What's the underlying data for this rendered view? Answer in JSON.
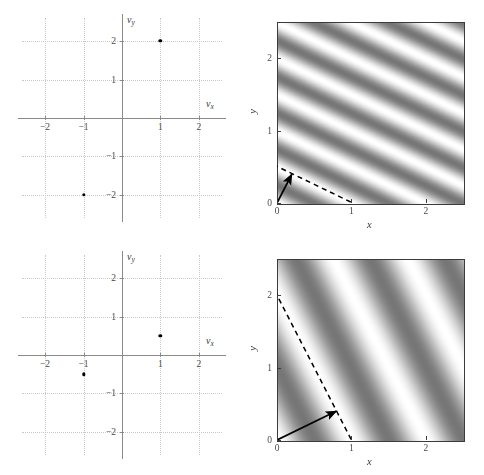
{
  "figure": {
    "title": "",
    "background": "#ffffff",
    "width": 484,
    "height": 475,
    "layout": "2 rows x 2 columns: left column = spatial-frequency spectrum scatter, right column = corresponding 2-D sinusoidal grating image"
  },
  "colors": {
    "ink": "#000000",
    "axis": "#8a8a8a",
    "grid": "#c9c9c9",
    "tick_text": "#4a4a4a",
    "image_border": "#3b3b3b",
    "grating_light": "#ffffff",
    "grating_dark": "#808080"
  },
  "chart_data": [
    {
      "id": "spectrum-top",
      "type": "scatter",
      "title": "",
      "xlabel": "νx",
      "ylabel": "νy",
      "xlabel_parts": {
        "symbol": "ν",
        "sub": "x"
      },
      "ylabel_parts": {
        "symbol": "ν",
        "sub": "y"
      },
      "xlim": [
        -2.6,
        2.6
      ],
      "ylim": [
        -2.6,
        2.6
      ],
      "xticks": [
        -2,
        -1,
        1,
        2
      ],
      "yticks": [
        -2,
        -1,
        1,
        2
      ],
      "xticklabels": [
        "−2",
        "−1",
        "1",
        "2"
      ],
      "yticklabels": [
        "−2",
        "−1",
        "1",
        "2"
      ],
      "grid": true,
      "gridstyle": "dotted",
      "points": [
        {
          "x": 1,
          "y": 2
        },
        {
          "x": -1,
          "y": -2
        }
      ],
      "marker": "filled circle",
      "note": "conjugate-symmetric pair of delta functions at ±(1, 2)"
    },
    {
      "id": "grating-top",
      "type": "heatmap",
      "title": "",
      "xlabel": "x",
      "ylabel": "y",
      "xlim": [
        0,
        2.5
      ],
      "ylim": [
        0,
        2.5
      ],
      "xticks": [
        0,
        1,
        2
      ],
      "yticks": [
        0,
        1,
        2
      ],
      "xticklabels": [
        "0",
        "1",
        "2"
      ],
      "yticklabels": [
        "0",
        "1",
        "2"
      ],
      "grid": false,
      "colormap": "gray",
      "function": "cos(2*pi*(1*x + 2*y))",
      "frequency": {
        "fx": 1,
        "fy": 2
      },
      "period": 0.447,
      "orientation_deg": 26.57,
      "annotations": [
        {
          "kind": "arrow",
          "label": "wave-vector arrow",
          "from": [
            0,
            0
          ],
          "to": [
            0.2,
            0.4
          ]
        },
        {
          "kind": "dashed-line",
          "label": "wavefront / crest line",
          "from": [
            -0.05,
            0.53
          ],
          "to": [
            1.12,
            -0.05
          ]
        }
      ]
    },
    {
      "id": "spectrum-bottom",
      "type": "scatter",
      "title": "",
      "xlabel": "νx",
      "ylabel": "νy",
      "xlabel_parts": {
        "symbol": "ν",
        "sub": "x"
      },
      "ylabel_parts": {
        "symbol": "ν",
        "sub": "y"
      },
      "xlim": [
        -2.6,
        2.6
      ],
      "ylim": [
        -2.6,
        2.6
      ],
      "xticks": [
        -2,
        -1,
        1,
        2
      ],
      "yticks": [
        -2,
        -1,
        1,
        2
      ],
      "xticklabels": [
        "−2",
        "−1",
        "1",
        "2"
      ],
      "yticklabels": [
        "−2",
        "−1",
        "1",
        "2"
      ],
      "grid": true,
      "gridstyle": "dotted",
      "points": [
        {
          "x": 1,
          "y": 0.5
        },
        {
          "x": -1,
          "y": -0.5
        }
      ],
      "marker": "filled circle",
      "note": "conjugate-symmetric pair of delta functions at ±(1, 0.5)"
    },
    {
      "id": "grating-bottom",
      "type": "heatmap",
      "title": "",
      "xlabel": "x",
      "ylabel": "y",
      "xlim": [
        0,
        2.5
      ],
      "ylim": [
        0,
        2.5
      ],
      "xticks": [
        0,
        1,
        2
      ],
      "yticks": [
        0,
        1,
        2
      ],
      "xticklabels": [
        "0",
        "1",
        "2"
      ],
      "yticklabels": [
        "0",
        "1",
        "2"
      ],
      "grid": false,
      "colormap": "gray",
      "function": "cos(2*pi*(1*x + 0.5*y))",
      "frequency": {
        "fx": 1,
        "fy": 0.5
      },
      "period": 0.894,
      "orientation_deg": 63.43,
      "annotations": [
        {
          "kind": "arrow",
          "label": "wave-vector arrow",
          "from": [
            0,
            0
          ],
          "to": [
            0.8,
            0.4
          ]
        },
        {
          "kind": "dashed-line",
          "label": "wavefront / crest line",
          "from": [
            -0.03,
            2.06
          ],
          "to": [
            1.0,
            0.0
          ]
        }
      ]
    }
  ]
}
